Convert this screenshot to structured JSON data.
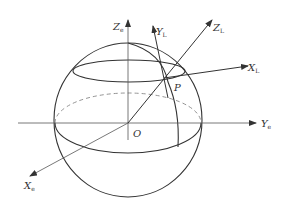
{
  "diagram": {
    "type": "coordinate-system-on-sphere",
    "labels": {
      "origin": "O",
      "point": "P",
      "ze": {
        "main": "Z",
        "sub": "e"
      },
      "ye": {
        "main": "Y",
        "sub": "e"
      },
      "xe": {
        "main": "X",
        "sub": "e"
      },
      "zl": {
        "main": "Z",
        "sub": "L"
      },
      "yl": {
        "main": "Y",
        "sub": "L"
      },
      "xl": {
        "main": "X",
        "sub": "L"
      }
    },
    "colors": {
      "stroke": "#333333",
      "axis": "#555555",
      "background": "#ffffff"
    }
  }
}
